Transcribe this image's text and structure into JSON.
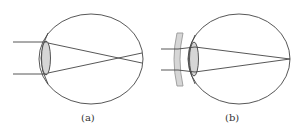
{
  "figures": [
    {
      "id": "a",
      "label": "(a)",
      "description": "Myopic eye: parallel rays focus in front of retina"
    },
    {
      "id": "b",
      "label": "(b)",
      "description": "Myopia corrected with concave (diverging) lens: rays focus on retina"
    }
  ],
  "colors": {
    "stroke": "#444444",
    "lens_fill": "#d6d6d6",
    "corrective_lens_fill": "#d6d6d6",
    "background": "#ffffff"
  }
}
